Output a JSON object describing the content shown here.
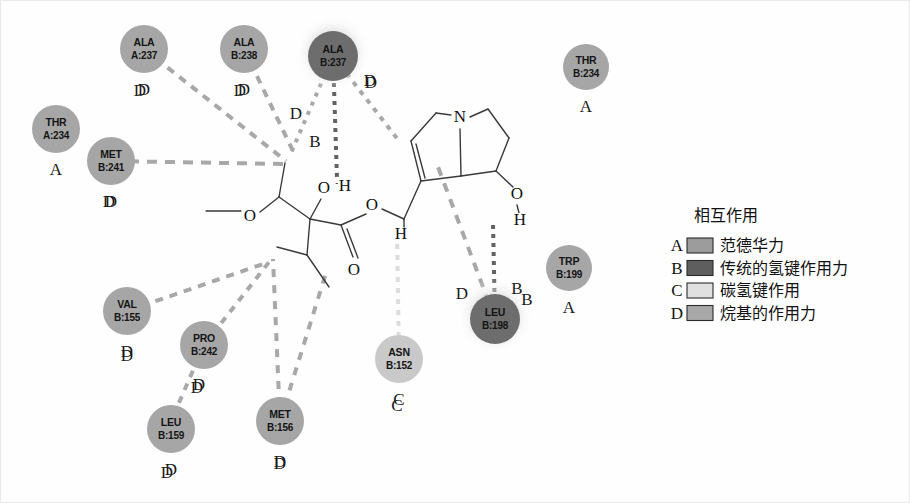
{
  "figure": {
    "kind": "ligand-protein-2d-interaction-diagram",
    "background_color": "#ffffff",
    "frame_color": "#e9e9e9",
    "width": 910,
    "height": 503
  },
  "legend": {
    "title": "相互作用",
    "entries": [
      {
        "letter": "A",
        "label": "范德华力",
        "color": "#9c9c9c",
        "code": "van-der-waals"
      },
      {
        "letter": "B",
        "label": "传统的氢键作用力",
        "color": "#5e5e5e",
        "code": "conventional-hydrogen-bond"
      },
      {
        "letter": "C",
        "label": "碳氢键作用",
        "color": "#e0e0e0",
        "code": "carbon-hydrogen-bond"
      },
      {
        "letter": "D",
        "label": "烷基的作用力",
        "color": "#a8a8a8",
        "code": "alkyl"
      }
    ]
  },
  "residues": [
    {
      "id": "ala-a-237",
      "name": "ALA",
      "chain_res": "A:237",
      "type": "D",
      "cx": 143,
      "cy": 48,
      "r": 24,
      "fill": "#a6a6a6",
      "label_dx": 0,
      "label_dy": 46
    },
    {
      "id": "ala-b-238",
      "name": "ALA",
      "chain_res": "B:238",
      "type": "D",
      "cx": 243,
      "cy": 48,
      "r": 24,
      "fill": "#a6a6a6",
      "label_dx": 0,
      "label_dy": 46
    },
    {
      "id": "ala-b-237",
      "name": "ALA",
      "chain_res": "B:237",
      "type": "D",
      "cx": 332,
      "cy": 55,
      "r": 25,
      "fill": "#6d6d6d",
      "label_dx": 38,
      "label_dy": 32,
      "halo": true,
      "dark": true
    },
    {
      "id": "thr-b-234",
      "name": "THR",
      "chain_res": "B:234",
      "type": "A",
      "cx": 585,
      "cy": 66,
      "r": 23,
      "fill": "#a6a6a6",
      "label_dx": 0,
      "label_dy": 45
    },
    {
      "id": "thr-a-234",
      "name": "THR",
      "chain_res": "A:234",
      "type": "A",
      "cx": 55,
      "cy": 128,
      "r": 24,
      "fill": "#a6a6a6",
      "label_dx": 0,
      "label_dy": 46
    },
    {
      "id": "met-b-241",
      "name": "MET",
      "chain_res": "B:241",
      "type": "D",
      "cx": 110,
      "cy": 160,
      "r": 24,
      "fill": "#a6a6a6",
      "label_dx": 0,
      "label_dy": 46
    },
    {
      "id": "trp-b-199",
      "name": "TRP",
      "chain_res": "B:199",
      "type": "A",
      "cx": 568,
      "cy": 267,
      "r": 23,
      "fill": "#a6a6a6",
      "label_dx": 0,
      "label_dy": 45
    },
    {
      "id": "leu-b-198",
      "name": "LEU",
      "chain_res": "B:198",
      "type": "B",
      "cx": 494,
      "cy": 318,
      "r": 25,
      "fill": "#6d6d6d",
      "label_dx": 32,
      "label_dy": -14,
      "halo": true,
      "dark": true
    },
    {
      "id": "val-b-155",
      "name": "VAL",
      "chain_res": "B:155",
      "type": "D",
      "cx": 126,
      "cy": 310,
      "r": 24,
      "fill": "#a6a6a6",
      "label_dx": 0,
      "label_dy": 46
    },
    {
      "id": "pro-b-242",
      "name": "PRO",
      "chain_res": "B:242",
      "type": "D",
      "cx": 203,
      "cy": 344,
      "r": 24,
      "fill": "#a6a6a6",
      "label_dx": -5,
      "label_dy": 45
    },
    {
      "id": "asn-b-152",
      "name": "ASN",
      "chain_res": "B:152",
      "type": "C",
      "cx": 398,
      "cy": 358,
      "r": 24,
      "fill": "#c9c9c9",
      "label_dx": 0,
      "label_dy": 46
    },
    {
      "id": "met-b-156",
      "name": "MET",
      "chain_res": "B:156",
      "type": "D",
      "cx": 279,
      "cy": 420,
      "r": 24,
      "fill": "#a6a6a6",
      "label_dx": 0,
      "label_dy": 46
    },
    {
      "id": "leu-b-159",
      "name": "LEU",
      "chain_res": "B:159",
      "type": "D",
      "cx": 170,
      "cy": 428,
      "r": 24,
      "fill": "#a6a6a6",
      "label_dx": 0,
      "label_dy": 46
    }
  ],
  "interactions": [
    {
      "id": "i-ala-a-237",
      "from": "ala-a-237",
      "to_x": 285,
      "to_y": 160,
      "type": "D",
      "color": "#a8a8a8",
      "dash": "8 7",
      "width": 4,
      "letter_x": 139,
      "letter_y": 95
    },
    {
      "id": "i-ala-b-238",
      "from": "ala-b-238",
      "to_x": 291,
      "to_y": 148,
      "type": "D",
      "color": "#a8a8a8",
      "dash": "8 7",
      "width": 4,
      "letter_x": 239,
      "letter_y": 95
    },
    {
      "id": "i-met-b-241",
      "from": "met-b-241",
      "to_x": 282,
      "to_y": 163,
      "type": "D",
      "color": "#a8a8a8",
      "dash": "10 8",
      "width": 4,
      "letter_x": 108,
      "letter_y": 206
    },
    {
      "id": "i-ala-b-237-left",
      "from": "ala-b-237",
      "to_x": 290,
      "to_y": 152,
      "type": "D",
      "color": "#a8a8a8",
      "dash": "4 6",
      "width": 4,
      "letter_x": 295,
      "letter_y": 118
    },
    {
      "id": "i-ala-b-237-hbond",
      "from": "ala-b-237",
      "to_x": 336,
      "to_y": 178,
      "type": "B",
      "color": "#616161",
      "dash": "4 5",
      "width": 4,
      "letter_x": 314,
      "letter_y": 146
    },
    {
      "id": "i-ala-b-237-right",
      "from": "ala-b-237",
      "to_x": 398,
      "to_y": 140,
      "type": "D",
      "color": "#a8a8a8",
      "dash": "5 6",
      "width": 4,
      "letter_x": 369,
      "letter_y": 85
    },
    {
      "id": "i-leu-b-198-hbond",
      "from": "leu-b-198",
      "to_x": 492,
      "to_y": 222,
      "type": "B",
      "color": "#616161",
      "dash": "4 5",
      "width": 4,
      "letter_x": 516,
      "letter_y": 293
    },
    {
      "id": "i-leu-b-198-alkyl",
      "from": "leu-b-198",
      "to_x": 437,
      "to_y": 166,
      "type": "D",
      "color": "#a8a8a8",
      "dash": "9 8",
      "width": 4,
      "letter_x": 461,
      "letter_y": 298
    },
    {
      "id": "i-asn-b-152",
      "from": "asn-b-152",
      "to_x": 396,
      "to_y": 230,
      "type": "C",
      "color": "#dcdcdc",
      "dash": "5 6",
      "width": 4,
      "letter_x": 396,
      "letter_y": 410
    },
    {
      "id": "i-val-b-155",
      "from": "val-b-155",
      "to_x": 265,
      "to_y": 262,
      "type": "D",
      "color": "#a8a8a8",
      "dash": "8 7",
      "width": 4,
      "letter_x": 126,
      "letter_y": 360
    },
    {
      "id": "i-pro-b-242",
      "from": "pro-b-242",
      "to_x": 272,
      "to_y": 256,
      "type": "D",
      "color": "#a8a8a8",
      "dash": "7 7",
      "width": 4,
      "letter_x": 196,
      "letter_y": 392
    },
    {
      "id": "i-pro-leu-159",
      "from": "pro-b-242",
      "to_x": 177,
      "to_y": 404,
      "type": "D",
      "color": "#a8a8a8",
      "dash": "7 7",
      "width": 4,
      "letter_x": 166,
      "letter_y": 477
    },
    {
      "id": "i-met-b-156-a",
      "from": "met-b-156",
      "to_x": 272,
      "to_y": 258,
      "type": "D",
      "color": "#a8a8a8",
      "dash": "8 8",
      "width": 4,
      "letter_x": 279,
      "letter_y": 468
    },
    {
      "id": "i-met-b-156-b",
      "from": "met-b-156",
      "to_x": 325,
      "to_y": 272,
      "type": "D",
      "color": "#a8a8a8",
      "dash": "8 8",
      "width": 4
    }
  ],
  "ligand": {
    "atoms": [
      {
        "id": "n1",
        "text": "N",
        "x": 459,
        "y": 117
      },
      {
        "id": "o_me",
        "text": "O",
        "x": 249,
        "y": 216
      },
      {
        "id": "o_h",
        "text": "O",
        "x": 323,
        "y": 188
      },
      {
        "id": "o_charge",
        "text": "-",
        "x": 336,
        "y": 182,
        "small": true
      },
      {
        "id": "h_hb",
        "text": "H",
        "x": 344,
        "y": 186
      },
      {
        "id": "o_est",
        "text": "O",
        "x": 371,
        "y": 205
      },
      {
        "id": "o_dbl",
        "text": "O",
        "x": 353,
        "y": 270
      },
      {
        "id": "h_ch",
        "text": "H",
        "x": 400,
        "y": 234
      },
      {
        "id": "o_oh",
        "text": "O",
        "x": 516,
        "y": 194
      },
      {
        "id": "h_oh",
        "text": "H",
        "x": 519,
        "y": 220
      }
    ],
    "bonds": [
      {
        "id": "b1",
        "d": "M 205 210 L 240 210"
      },
      {
        "id": "b2",
        "d": "M 259 211 L 278 196"
      },
      {
        "id": "b3",
        "d": "M 278 196 L 284 162"
      },
      {
        "id": "b4",
        "d": "M 278 196 L 309 218"
      },
      {
        "id": "b5",
        "d": "M 309 218 L 320 198"
      },
      {
        "id": "b6",
        "d": "M 309 218 L 340 224"
      },
      {
        "id": "b7",
        "d": "M 309 218 L 306 254"
      },
      {
        "id": "b8",
        "d": "M 306 254 L 276 246"
      },
      {
        "id": "b9",
        "d": "M 306 254 L 328 286"
      },
      {
        "id": "b10",
        "d": "M 340 224 L 352 256"
      },
      {
        "id": "b11",
        "d": "M 346 228 L 357 257"
      },
      {
        "id": "b12",
        "d": "M 340 224 L 365 213"
      },
      {
        "id": "b13",
        "d": "M 381 208 L 403 218"
      },
      {
        "id": "b14",
        "d": "M 403 218 L 403 230"
      },
      {
        "id": "b15",
        "d": "M 403 218 L 420 180"
      },
      {
        "id": "b16",
        "d": "M 420 180 L 410 140"
      },
      {
        "id": "b17",
        "d": "M 424 177 L 415 143"
      },
      {
        "id": "b18",
        "d": "M 410 140 L 435 112"
      },
      {
        "id": "b19",
        "d": "M 435 112 L 450 114"
      },
      {
        "id": "b20",
        "d": "M 469 116 L 487 108"
      },
      {
        "id": "b21",
        "d": "M 487 108 L 508 137"
      },
      {
        "id": "b22",
        "d": "M 508 137 L 495 170"
      },
      {
        "id": "b23",
        "d": "M 495 170 L 460 175"
      },
      {
        "id": "b24",
        "d": "M 460 175 L 459 128"
      },
      {
        "id": "b25",
        "d": "M 460 175 L 420 180"
      },
      {
        "id": "b26",
        "d": "M 495 170 L 512 186"
      },
      {
        "id": "b27",
        "d": "M 516 204 L 518 212"
      }
    ]
  }
}
